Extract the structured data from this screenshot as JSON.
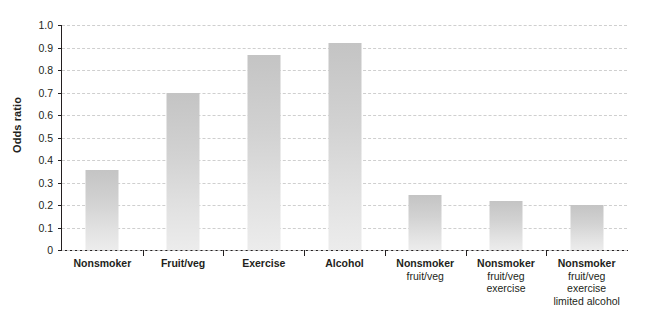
{
  "chart_data": {
    "type": "bar",
    "title": "",
    "xlabel": "",
    "ylabel": "Odds ratio",
    "ylim": [
      0,
      1.0
    ],
    "ytick_labels": [
      "1.0",
      "0.9",
      "0.8",
      "0.7",
      "0.6",
      "0.5",
      "0.4",
      "0.3",
      "0.2",
      "0.1",
      "0"
    ],
    "ytick_values": [
      1.0,
      0.9,
      0.8,
      0.7,
      0.6,
      0.5,
      0.4,
      0.3,
      0.2,
      0.1,
      0
    ],
    "grid": true,
    "legend": "none",
    "categories": [
      "Nonsmoker",
      "Fruit/veg",
      "Exercise",
      "Alcohol",
      "Nonsmoker fruit/veg",
      "Nonsmoker fruit/veg exercise",
      "Nonsmoker fruit/veg exercise limited alcohol"
    ],
    "category_lines": [
      [
        "Nonsmoker"
      ],
      [
        "Fruit/veg"
      ],
      [
        "Exercise"
      ],
      [
        "Alcohol"
      ],
      [
        "Nonsmoker",
        "fruit/veg"
      ],
      [
        "Nonsmoker",
        "fruit/veg",
        "exercise"
      ],
      [
        "Nonsmoker",
        "fruit/veg",
        "exercise",
        "limited alcohol"
      ]
    ],
    "values": [
      0.355,
      0.7,
      0.865,
      0.92,
      0.245,
      0.22,
      0.2
    ],
    "bar_color_top": "#c4c4c4",
    "bar_color_bottom": "#ececec",
    "axis_color": "#231f20",
    "gridline_color": "#cfcfcf"
  }
}
